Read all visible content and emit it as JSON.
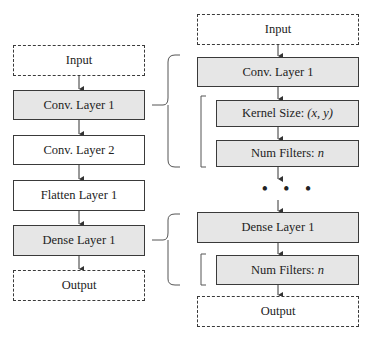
{
  "left_column": {
    "nodes": [
      {
        "label": "Input",
        "style": "dashed"
      },
      {
        "label": "Conv. Layer 1",
        "style": "gray"
      },
      {
        "label": "Conv. Layer 2",
        "style": "plain"
      },
      {
        "label": "Flatten Layer 1",
        "style": "plain"
      },
      {
        "label": "Dense Layer 1",
        "style": "gray"
      },
      {
        "label": "Output",
        "style": "dashed"
      }
    ]
  },
  "right_column": {
    "nodes": [
      {
        "label": "Input",
        "style": "dashed"
      },
      {
        "label": "Conv. Layer 1",
        "style": "gray"
      },
      {
        "label_prefix": "Kernel Size: ",
        "label_var": "(x, y)",
        "style": "gray"
      },
      {
        "label_prefix": "Num Filters: ",
        "label_var": "n",
        "style": "gray"
      },
      {
        "label": "Dense Layer 1",
        "style": "gray"
      },
      {
        "label_prefix": "Num Filters: ",
        "label_var": "n",
        "style": "gray"
      },
      {
        "label": "Output",
        "style": "dashed"
      }
    ],
    "ellipsis": "• • •"
  },
  "colors": {
    "gray_fill": "#e6e6e6",
    "stroke": "#3a3a3a"
  }
}
